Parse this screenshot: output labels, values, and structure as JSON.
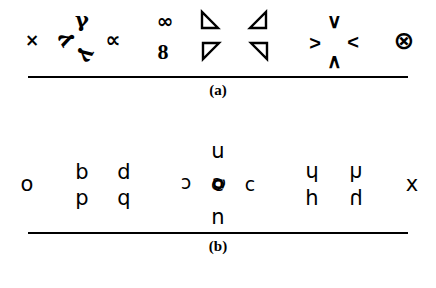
{
  "figure": {
    "panels": [
      {
        "id": "a",
        "caption": "(a)",
        "groups": [
          {
            "name": "cross-group",
            "glyphs": [
              {
                "name": "times-glyph",
                "char": "×",
                "x": 32,
                "y": 40,
                "cls": "sym sym-x",
                "rot": 0
              }
            ]
          },
          {
            "name": "gamma-triad-group",
            "glyphs": [
              {
                "name": "gamma-glyph-top",
                "char": "γ",
                "x": 82,
                "y": 19,
                "cls": "sym sym-gamma",
                "rot": 0
              },
              {
                "name": "gamma-glyph-left",
                "char": "γ",
                "x": 63,
                "y": 41,
                "cls": "sym sym-gamma",
                "rot": 240
              },
              {
                "name": "gamma-glyph-bottom",
                "char": "γ",
                "x": 88,
                "y": 56,
                "cls": "sym sym-gamma",
                "rot": 120
              }
            ]
          },
          {
            "name": "alpha-group",
            "glyphs": [
              {
                "name": "alpha-glyph",
                "char": "∝",
                "x": 113,
                "y": 40,
                "cls": "sym sym-alpha",
                "rot": 0
              }
            ]
          },
          {
            "name": "infinity-eight-group",
            "glyphs": [
              {
                "name": "infinity-glyph",
                "char": "∞",
                "x": 165,
                "y": 21,
                "cls": "sym sym-inf",
                "rot": 0
              },
              {
                "name": "eight-glyph",
                "char": "8",
                "x": 163,
                "y": 52,
                "cls": "sym sym-eight",
                "rot": 0
              }
            ]
          },
          {
            "name": "triangle-pair-left-group",
            "triangles": [
              {
                "name": "triangle-upper-left",
                "x": 210,
                "y": 22,
                "rot": 270
              },
              {
                "name": "triangle-lower-right",
                "x": 211,
                "y": 53,
                "rot": 0
              }
            ]
          },
          {
            "name": "triangle-pair-right-group",
            "triangles": [
              {
                "name": "triangle-upper-right",
                "x": 258,
                "y": 22,
                "rot": 180
              },
              {
                "name": "triangle-lower-left",
                "x": 259,
                "y": 53,
                "rot": 90
              }
            ]
          },
          {
            "name": "chevron-quad-group",
            "glyphs": [
              {
                "name": "chevron-right-glyph",
                "char": ">",
                "x": 315,
                "y": 43,
                "cls": "sym sym-chev",
                "rot": 0
              },
              {
                "name": "chevron-down-glyph",
                "char": "∨",
                "x": 334,
                "y": 21,
                "cls": "sym sym-chev",
                "rot": 0
              },
              {
                "name": "chevron-left-glyph",
                "char": "<",
                "x": 353,
                "y": 42,
                "cls": "sym sym-chev",
                "rot": 0
              },
              {
                "name": "chevron-up-glyph",
                "char": "∧",
                "x": 334,
                "y": 61,
                "cls": "sym sym-chev",
                "rot": 0
              }
            ]
          },
          {
            "name": "circled-times-group",
            "glyphs": [
              {
                "name": "circled-times-glyph",
                "char": "⊗",
                "x": 404,
                "y": 40,
                "cls": "sym sym-otimes",
                "rot": 0
              }
            ]
          }
        ]
      },
      {
        "id": "b",
        "caption": "(b)",
        "groups": [
          {
            "name": "letter-o-group",
            "glyphs": [
              {
                "name": "letter-o",
                "char": "o",
                "x": 27,
                "y": 52,
                "cls": "ltr",
                "rot": 0
              }
            ]
          },
          {
            "name": "bdpq-group",
            "glyphs": [
              {
                "name": "letter-b",
                "char": "b",
                "x": 82,
                "y": 40,
                "cls": "ltr",
                "rot": 0
              },
              {
                "name": "letter-d",
                "char": "d",
                "x": 124,
                "y": 40,
                "cls": "ltr",
                "rot": 0
              },
              {
                "name": "letter-p",
                "char": "p",
                "x": 82,
                "y": 66,
                "cls": "ltr",
                "rot": 0
              },
              {
                "name": "letter-q",
                "char": "q",
                "x": 124,
                "y": 66,
                "cls": "ltr",
                "rot": 0
              }
            ]
          },
          {
            "name": "cun-knot-group",
            "glyphs": [
              {
                "name": "letter-c-reversed",
                "char": "c",
                "x": 186,
                "y": 52,
                "cls": "ltr ltr-small",
                "rot": 180
              },
              {
                "name": "letter-u",
                "char": "u",
                "x": 218,
                "y": 19,
                "cls": "ltr",
                "rot": 0
              },
              {
                "name": "letter-n",
                "char": "n",
                "x": 218,
                "y": 85,
                "cls": "ltr",
                "rot": 0
              },
              {
                "name": "letter-c",
                "char": "c",
                "x": 250,
                "y": 52,
                "cls": "ltr ltr-small",
                "rot": 0
              }
            ],
            "knot": {
              "name": "cun-superposition-knot",
              "x": 218,
              "y": 52,
              "chars": {
                "c": "c",
                "c_rot": "c",
                "u": "c",
                "n": "c"
              }
            }
          },
          {
            "name": "hmu-group",
            "glyphs": [
              {
                "name": "letter-h-rot180-top-left",
                "char": "h",
                "x": 312,
                "y": 40,
                "cls": "ltr",
                "rot": 180
              },
              {
                "name": "letter-h-flip-top-right",
                "char": "h",
                "x": 356,
                "y": 40,
                "cls": "ltr",
                "rot": 180,
                "flip": true
              },
              {
                "name": "letter-h-bottom-left",
                "char": "h",
                "x": 312,
                "y": 66,
                "cls": "ltr",
                "rot": 0
              },
              {
                "name": "letter-h-flip-bottom-right",
                "char": "h",
                "x": 356,
                "y": 66,
                "cls": "ltr",
                "rot": 0,
                "flip": true
              }
            ]
          },
          {
            "name": "letter-x-group",
            "glyphs": [
              {
                "name": "letter-x",
                "char": "x",
                "x": 412,
                "y": 52,
                "cls": "ltr",
                "rot": 0
              }
            ]
          }
        ]
      }
    ]
  }
}
